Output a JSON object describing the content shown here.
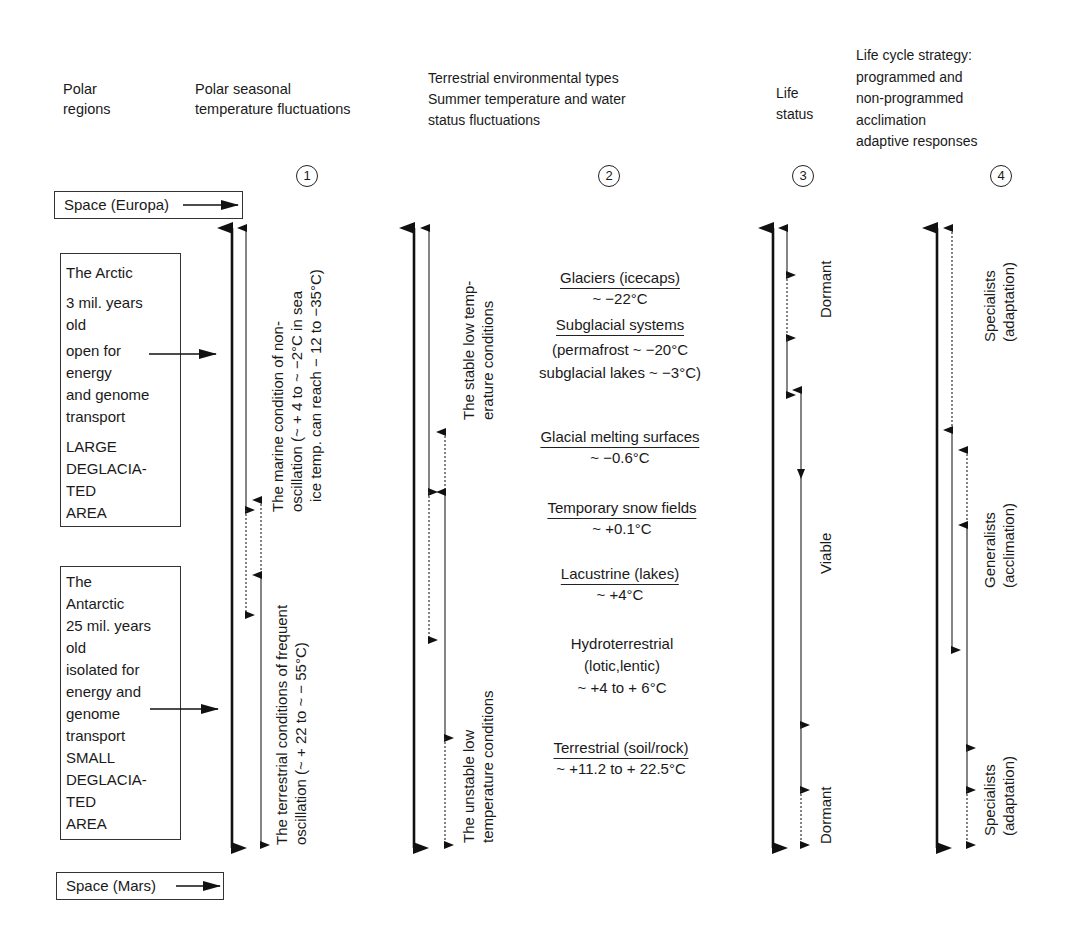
{
  "headers": {
    "col0": [
      "Polar",
      "regions"
    ],
    "col1": [
      "Polar seasonal",
      "temperature fluctuations"
    ],
    "col2": [
      "Terrestrial environmental types",
      "Summer temperature and water",
      "status fluctuations"
    ],
    "col3": [
      "Life",
      "status"
    ],
    "col4": [
      "Life cycle strategy:",
      "programmed and",
      "non-programmed",
      "acclimation",
      "adaptive responses"
    ]
  },
  "column_numbers": [
    "1",
    "2",
    "3",
    "4"
  ],
  "space_top": "Space (Europa)",
  "space_bottom": "Space (Mars)",
  "arctic": {
    "lines": [
      "The Arctic",
      "3 mil. years",
      "old",
      "open for",
      "energy",
      "and genome",
      "transport",
      "LARGE",
      "DEGLACIA-",
      "TED",
      "AREA"
    ]
  },
  "antarctic": {
    "lines": [
      "The",
      "Antarctic",
      "25 mil. years",
      "old",
      "isolated for",
      "energy and",
      "genome",
      "transport",
      "SMALL",
      "DEGLACIA-",
      "TED",
      "AREA"
    ]
  },
  "seasonal": {
    "marine": [
      "The marine condition of non-",
      "oscillation (~ + 4 to ~ −2°C in sea",
      "ice temp. can reach − 12 to −35°C)"
    ],
    "terrestrial": [
      "The terrestrial conditions of frequent",
      "oscillation (~ + 22 to ~ − 55°C)"
    ]
  },
  "conditions": {
    "stable": [
      "The stable low temp-",
      "erature conditions"
    ],
    "unstable": [
      "The unstable low",
      "temperature conditions"
    ]
  },
  "environments": [
    {
      "name": "Glaciers (icecaps)",
      "temp": [
        "~ −22°C"
      ]
    },
    {
      "name": "Subglacial systems",
      "temp": [
        "(permafrost ~ −20°C",
        "subglacial lakes ~ −3°C)"
      ]
    },
    {
      "name": "Glacial melting surfaces",
      "temp": [
        "~ −0.6°C"
      ]
    },
    {
      "name": "Temporary snow fields",
      "temp": [
        "~ +0.1°C"
      ]
    },
    {
      "name": "Lacustrine (lakes)",
      "temp": [
        "~ +4°C"
      ]
    },
    {
      "name": "Hydroterrestrial",
      "temp": [
        "(lotic,lentic)",
        "~ +4 to + 6°C"
      ]
    },
    {
      "name": "Terrestrial (soil/rock)",
      "temp": [
        "~ +11.2 to + 22.5°C"
      ]
    }
  ],
  "life_status": {
    "dormant_top": "Dormant",
    "viable": "Viable",
    "dormant_bottom": "Dormant"
  },
  "strategy": {
    "specialists_top": [
      "Specialists",
      "(adaptation)"
    ],
    "generalists": [
      "Generalists",
      "(acclimation)"
    ],
    "specialists_bottom": [
      "Specialists",
      "(adaptation)"
    ]
  },
  "icons": {
    "arrow": "arrow-icon",
    "circled_number": "circled-number-icon"
  },
  "colors": {
    "ink": "#1a1a1a",
    "background": "#ffffff"
  }
}
